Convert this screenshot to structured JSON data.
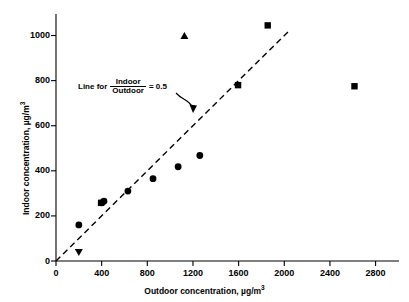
{
  "chart_data": {
    "type": "scatter",
    "title": "",
    "xlabel": "Outdoor concentration, µg/m³",
    "ylabel": "Indoor concentration, µg/m³",
    "xlim": [
      0,
      2900
    ],
    "ylim": [
      0,
      1060
    ],
    "xticks": [
      0,
      400,
      800,
      1200,
      1600,
      2000,
      2400,
      2800
    ],
    "yticks": [
      0,
      200,
      400,
      600,
      800,
      1000
    ],
    "xtick_labels": [
      "0",
      "400",
      "800",
      "1200",
      "1600",
      "2000",
      "2400",
      "2800"
    ],
    "ytick_labels": [
      "0",
      "200",
      "400",
      "600",
      "800",
      "1000"
    ],
    "grid": false,
    "legend": "none",
    "series": [
      {
        "name": "circle-markers",
        "marker": "circle",
        "points": [
          {
            "x": 200,
            "y": 160
          },
          {
            "x": 420,
            "y": 265
          },
          {
            "x": 400,
            "y": 258
          },
          {
            "x": 630,
            "y": 310
          },
          {
            "x": 850,
            "y": 365
          },
          {
            "x": 1070,
            "y": 418
          },
          {
            "x": 1260,
            "y": 468
          }
        ]
      },
      {
        "name": "square-markers",
        "marker": "square",
        "points": [
          {
            "x": 395,
            "y": 258
          },
          {
            "x": 1595,
            "y": 780
          },
          {
            "x": 1855,
            "y": 1045
          },
          {
            "x": 2615,
            "y": 775
          }
        ]
      },
      {
        "name": "up-triangle-markers",
        "marker": "triangle-up",
        "points": [
          {
            "x": 1125,
            "y": 998
          }
        ]
      },
      {
        "name": "down-triangle-markers",
        "marker": "triangle-down",
        "points": [
          {
            "x": 200,
            "y": 40
          }
        ]
      }
    ],
    "reference_line": {
      "label_prefix": "Line for",
      "numerator": "Indoor",
      "denominator": "Outdoor",
      "equals": "= 0.5",
      "slope": 0.5,
      "intercept": 0,
      "style": "dashed",
      "x_start": 0,
      "x_end": 2050
    },
    "annotation": {
      "text": "Line for Indoor/Outdoor = 0.5",
      "arrow": "curved-arrow-to-line"
    }
  }
}
